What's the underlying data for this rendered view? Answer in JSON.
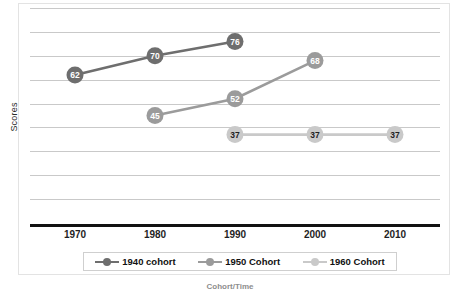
{
  "chart_data": {
    "type": "line",
    "title": "",
    "xlabel": "Cohort/Time",
    "ylabel": "Scores",
    "x": [
      "1970",
      "1980",
      "1990",
      "2000",
      "2010"
    ],
    "xlim": [
      1965,
      2015
    ],
    "ylim": [
      0,
      90
    ],
    "grid": true,
    "gridlines_y": [
      10,
      20,
      30,
      40,
      50,
      60,
      70,
      80,
      90
    ],
    "y_tick_labels_visible": false,
    "legend_position": "bottom",
    "series": [
      {
        "name": "1940 cohort",
        "color": "#6e6e6e",
        "label_color": "#ffffff",
        "points": [
          {
            "x": "1970",
            "y": 62,
            "label": "62"
          },
          {
            "x": "1980",
            "y": 70,
            "label": "70"
          },
          {
            "x": "1990",
            "y": 76,
            "label": "76"
          }
        ]
      },
      {
        "name": "1950 Cohort",
        "color": "#9b9b9b",
        "label_color": "#ffffff",
        "points": [
          {
            "x": "1980",
            "y": 45,
            "label": "45"
          },
          {
            "x": "1990",
            "y": 52,
            "label": "52"
          },
          {
            "x": "2000",
            "y": 68,
            "label": "68"
          }
        ]
      },
      {
        "name": "1960 Cohort",
        "color": "#c9c9c9",
        "label_color": "#1f1f1f",
        "points": [
          {
            "x": "1990",
            "y": 37,
            "label": "37"
          },
          {
            "x": "2000",
            "y": 37,
            "label": "37"
          },
          {
            "x": "2010",
            "y": 37,
            "label": "37"
          }
        ]
      }
    ]
  },
  "axes": {
    "y_title": "Scores",
    "x_title": "Cohort/Time",
    "x_ticks": [
      "1970",
      "1980",
      "1990",
      "2000",
      "2010"
    ]
  },
  "legend": {
    "entries": [
      {
        "label": "1940 cohort",
        "color": "#6e6e6e"
      },
      {
        "label": "1950 Cohort",
        "color": "#9b9b9b"
      },
      {
        "label": "1960 Cohort",
        "color": "#c9c9c9"
      }
    ]
  }
}
